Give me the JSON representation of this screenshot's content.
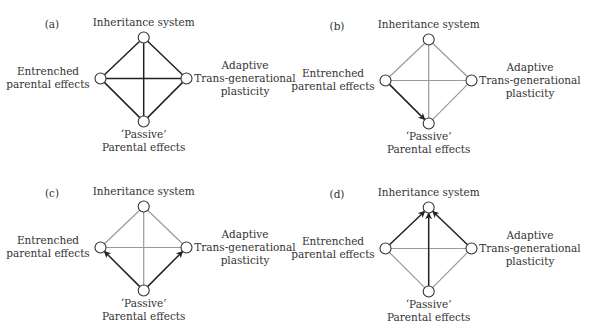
{
  "figure": {
    "colors": {
      "active_edge": "#222222",
      "inactive_edge": "#9a9a9a",
      "node_stroke": "#333333",
      "node_fill": "#ffffff",
      "text": "#333333"
    },
    "node_labels": {
      "top": [
        "Inheritance system"
      ],
      "left": [
        "Entrenched",
        "parental effects"
      ],
      "right": [
        "Adaptive",
        "Trans-generational",
        "plasticity"
      ],
      "bottom": [
        "‘Passive’",
        "Parental effects"
      ]
    },
    "edges": [
      {
        "from": "top",
        "to": "left"
      },
      {
        "from": "top",
        "to": "right"
      },
      {
        "from": "left",
        "to": "bottom"
      },
      {
        "from": "right",
        "to": "bottom"
      },
      {
        "from": "top",
        "to": "bottom"
      },
      {
        "from": "left",
        "to": "right"
      }
    ],
    "panels": [
      {
        "label": "(a)",
        "highlighted": [
          {
            "from": "top",
            "to": "left",
            "arrow": false
          },
          {
            "from": "top",
            "to": "right",
            "arrow": false
          },
          {
            "from": "left",
            "to": "bottom",
            "arrow": false
          },
          {
            "from": "right",
            "to": "bottom",
            "arrow": false
          },
          {
            "from": "top",
            "to": "bottom",
            "arrow": false
          },
          {
            "from": "left",
            "to": "right",
            "arrow": false
          }
        ]
      },
      {
        "label": "(b)",
        "highlighted": [
          {
            "from": "left",
            "to": "bottom",
            "arrow": true
          }
        ]
      },
      {
        "label": "(c)",
        "highlighted": [
          {
            "from": "bottom",
            "to": "left",
            "arrow": true
          },
          {
            "from": "bottom",
            "to": "right",
            "arrow": true
          }
        ]
      },
      {
        "label": "(d)",
        "highlighted": [
          {
            "from": "left",
            "to": "top",
            "arrow": true
          },
          {
            "from": "bottom",
            "to": "top",
            "arrow": true
          },
          {
            "from": "right",
            "to": "top",
            "arrow": true
          }
        ]
      }
    ]
  }
}
